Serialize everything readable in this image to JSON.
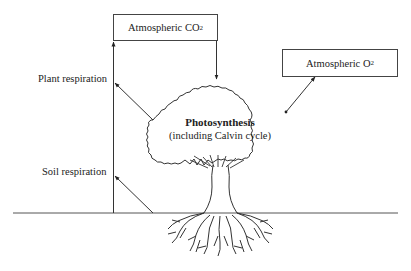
{
  "diagram": {
    "type": "carbon-cycle-tree",
    "boxes": {
      "co2": {
        "label": "Atmospheric CO",
        "subscript": "2"
      },
      "o2": {
        "label": "Atmospheric O",
        "subscript": "2"
      }
    },
    "labels": {
      "plant_respiration": "Plant respiration",
      "soil_respiration": "Soil respiration",
      "photosynthesis_title": "Photosynthesis",
      "photosynthesis_subtitle": "(including Calvin cycle)"
    },
    "arrows": [
      {
        "from": "atmospheric-co2",
        "to": "tree-canopy",
        "label": ""
      },
      {
        "from": "tree-canopy",
        "to": "atmospheric-o2",
        "label": ""
      },
      {
        "from": "tree-canopy",
        "to": "atmospheric-co2",
        "label": "Plant respiration"
      },
      {
        "from": "soil",
        "to": "atmospheric-co2",
        "label": "Soil respiration"
      }
    ],
    "colors": {
      "stroke": "#333333",
      "background": "#ffffff"
    }
  }
}
